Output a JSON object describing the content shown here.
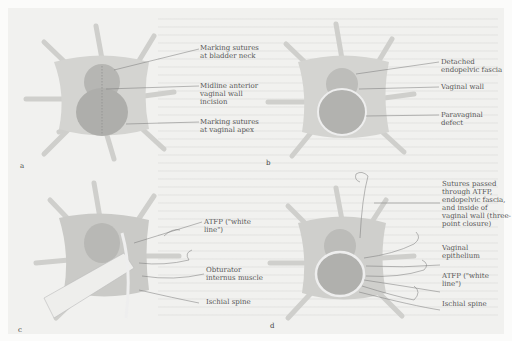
{
  "figure": {
    "panels": [
      {
        "id": "a",
        "letter": "a",
        "labels": [
          "Marking sutures at bladder neck",
          "Midline anterior vaginal wall incision",
          "Marking sutures at vaginal apex"
        ]
      },
      {
        "id": "b",
        "letter": "b",
        "labels": [
          "Detached endopelvic fascia",
          "Vaginal wall",
          "Paravaginal defect"
        ]
      },
      {
        "id": "c",
        "letter": "c",
        "labels": [
          "ATFP (\"white line\")",
          "Obturator internus muscle",
          "Ischial spine"
        ]
      },
      {
        "id": "d",
        "letter": "d",
        "labels": [
          "Sutures passed through ATFP, endopelvic fascia, and inside of vaginal wall (three-point closure)",
          "Vaginal epithelium",
          "ATFP (\"white line\")",
          "Ischial spine"
        ]
      }
    ],
    "colors": {
      "background": "#f1f1ef",
      "tissue": "#c9c9c6",
      "tissue_dark": "#a9a9a6",
      "retractor": "#d6d6d3",
      "leader_line": "#777777"
    }
  }
}
